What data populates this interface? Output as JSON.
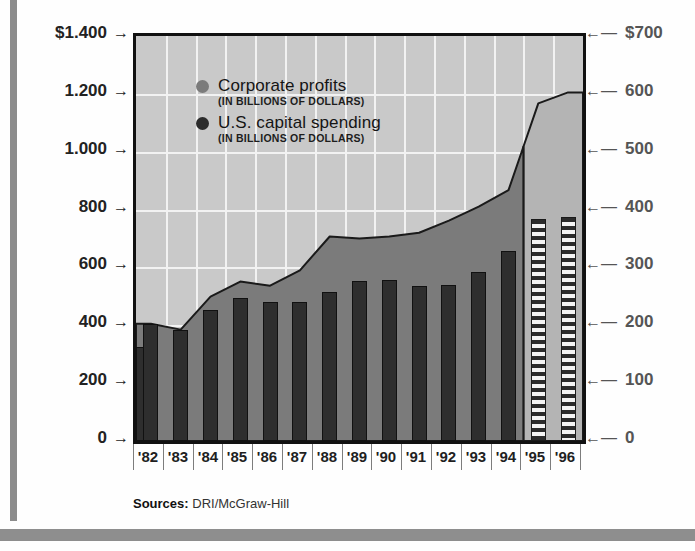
{
  "chart_data": {
    "type": "area",
    "title": "",
    "subtitle": "",
    "xlabel": "",
    "ylabel": "",
    "categories": [
      "'82",
      "'83",
      "'84",
      "'85",
      "'86",
      "'87",
      "'88",
      "'89",
      "'90",
      "'91",
      "'92",
      "'93",
      "'94",
      "'95",
      "'96"
    ],
    "left_axis": {
      "ticks": [
        "$1.400",
        "1.200",
        "1.000",
        "800",
        "600",
        "400",
        "200",
        "0"
      ],
      "values": [
        1400,
        1200,
        1000,
        800,
        600,
        400,
        200,
        0
      ],
      "ylim": [
        0,
        1400
      ],
      "arrow": "→"
    },
    "right_axis": {
      "ticks": [
        "$700",
        "600",
        "500",
        "400",
        "300",
        "200",
        "100",
        "0"
      ],
      "values": [
        700,
        600,
        500,
        400,
        300,
        200,
        100,
        0
      ],
      "ylim": [
        0,
        700
      ],
      "arrow": "←"
    },
    "grid": true,
    "legend_position": "inside-top-left",
    "series": [
      {
        "name": "Corporate profits",
        "unit": "(IN BILLIONS OF DOLLARS)",
        "render": "area",
        "axis": "left",
        "color": "#7b7b7b",
        "forecast_color": "#b4b4b4",
        "values": [
          405,
          385,
          499,
          551,
          537,
          590,
          707,
          700,
          707,
          720,
          762,
          810,
          867,
          1167,
          1205
        ],
        "forecast_from": "'95"
      },
      {
        "name": "U.S. capital spending",
        "unit": "(IN BILLIONS OF DOLLARS)",
        "render": "bar",
        "axis": "right",
        "color": "#2e2e2e",
        "forecast_pattern": "horizontal-stripes",
        "values_left_scale": [
          405,
          385,
          454,
          495,
          482,
          482,
          516,
          554,
          558,
          537,
          541,
          585,
          658,
          769,
          776
        ],
        "values": [
          202,
          192,
          227,
          248,
          241,
          241,
          258,
          277,
          279,
          268,
          270,
          292,
          329,
          384,
          388
        ],
        "forecast_from": "'95"
      }
    ],
    "first_bar_partial": {
      "category": "'82",
      "value_left_scale": 325,
      "note": "leading half bar"
    }
  },
  "legend": {
    "profits": {
      "label": "Corporate profits",
      "unit": "(IN BILLIONS OF DOLLARS)",
      "dot": "legend-dot-gray"
    },
    "capital": {
      "label": "U.S. capital spending",
      "unit": "(IN BILLIONS OF DOLLARS)",
      "dot": "legend-dot-dark"
    }
  },
  "sources": {
    "label": "Sources:",
    "value": " DRI/McGraw-Hill"
  },
  "colors": {
    "plot_background": "#c9c9c9",
    "profits_actual": "#7b7b7b",
    "profits_forecast": "#b4b4b4",
    "capital_bar": "#2e2e2e",
    "grid": "#f2f2f2",
    "frame": "#111111",
    "left_tick_text": "#222222",
    "right_tick_text": "#555555"
  }
}
